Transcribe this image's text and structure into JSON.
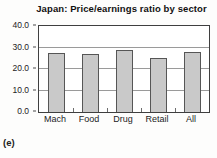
{
  "panel_label": "(e)",
  "chart_data": {
    "type": "bar",
    "title": "Japan: Price/earnings ratio by sector",
    "categories": [
      "Mach",
      "Food",
      "Drug",
      "Retail",
      "All"
    ],
    "values": [
      27.5,
      27,
      29,
      25,
      28
    ],
    "xlabel": "",
    "ylabel": "",
    "ylim": [
      0,
      40
    ],
    "ytick_labels": [
      "0.0",
      "10.0",
      "20.0",
      "30.0",
      "40.0"
    ],
    "yticks": [
      0,
      10,
      20,
      30,
      40
    ],
    "grid": "horizontal",
    "legend_position": "none",
    "bar_fill_color": "#c9c9c9",
    "bar_border_color": "#565656",
    "plot_border_color": "#3f3f3f",
    "gridline_color": "#9a9a9a"
  }
}
